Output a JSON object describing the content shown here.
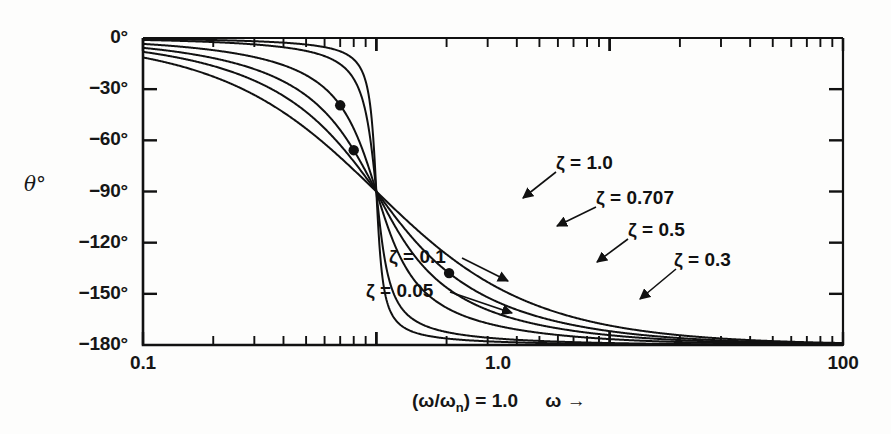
{
  "figure": {
    "kind": "phase-angle-bode-plot",
    "background_color": "#fdfdfc",
    "line_color": "#111111"
  },
  "axes": {
    "y_axis_title": "θ°",
    "y_tick_labels": [
      "0°",
      "−30°",
      "−60°",
      "−90°",
      "−120°",
      "−150°",
      "−180°"
    ],
    "x_tick_labels": [
      "0.1",
      "1.0",
      "100"
    ],
    "x_caption_ratio": "(ω/ω",
    "x_caption_sub": "n",
    "x_caption_rest": ") = 1.0",
    "x_caption_omega": "ω →"
  },
  "curve_labels": [
    {
      "id": "zeta-1-0",
      "text": "ζ = 1.0",
      "x": 556,
      "y": 152
    },
    {
      "id": "zeta-0-707",
      "text": "ζ = 0.707",
      "x": 596,
      "y": 187
    },
    {
      "id": "zeta-0-5",
      "text": "ζ = 0.5",
      "x": 628,
      "y": 219
    },
    {
      "id": "zeta-0-3",
      "text": "ζ = 0.3",
      "x": 674,
      "y": 249
    },
    {
      "id": "zeta-0-1",
      "text": "ζ = 0.1",
      "x": 389,
      "y": 246
    },
    {
      "id": "zeta-0-05",
      "text": "ζ = 0.05",
      "x": 366,
      "y": 280
    }
  ],
  "chart_data": {
    "type": "line",
    "title": "",
    "xlabel": "(ω/ωn) = 1.0   ω →",
    "ylabel": "θ°",
    "xscale": "log",
    "xlim": [
      0.1,
      100
    ],
    "ylim": [
      -180,
      0
    ],
    "yticks": [
      0,
      -30,
      -60,
      -90,
      -120,
      -150,
      -180
    ],
    "ytick_labels": [
      "0°",
      "−30°",
      "−60°",
      "−90°",
      "−120°",
      "−150°",
      "−180°"
    ],
    "xticks": [
      0.1,
      1.0,
      100
    ],
    "xtick_labels": [
      "0.1",
      "1.0",
      "100"
    ],
    "grid": false,
    "legend": "inline-annotations",
    "formula": "theta = -atan2(2*zeta*r, 1 - r^2), r = omega/omega_n",
    "series": [
      {
        "name": "ζ = 1.0",
        "zeta": 1.0,
        "x": [
          0.1,
          0.2,
          0.3,
          0.5,
          0.7,
          1.0,
          1.5,
          2.0,
          3.0,
          5.0,
          10.0,
          30.0,
          100.0
        ],
        "values": [
          -11.5,
          -23.5,
          -36.5,
          -67.4,
          -107.3,
          -90.0,
          -123.9,
          -143.1,
          -153.4,
          -165.1,
          -168.6,
          -173.2,
          -178.9
        ]
      },
      {
        "name": "ζ = 0.707",
        "zeta": 0.707,
        "x": [
          0.1,
          0.2,
          0.3,
          0.5,
          0.7,
          1.0,
          1.5,
          2.0,
          3.0,
          5.0,
          10.0,
          30.0,
          100.0
        ],
        "values": [
          -8.2,
          -16.8,
          -26.3,
          -43.3,
          -68.9,
          -90.0,
          -131.6,
          -146.6,
          -157.8,
          -163.7,
          -171.8,
          -177.3,
          -179.2
        ]
      },
      {
        "name": "ζ = 0.5",
        "zeta": 0.5,
        "x": [
          0.1,
          0.2,
          0.3,
          0.5,
          0.7,
          1.0,
          1.5,
          2.0,
          3.0,
          5.0,
          10.0,
          30.0,
          100.0
        ],
        "values": [
          -5.8,
          -11.9,
          -18.8,
          -33.7,
          -56.4,
          -90.0,
          -140.2,
          -146.3,
          -161.6,
          -168.3,
          -174.2,
          -178.0,
          -179.4
        ]
      },
      {
        "name": "ζ = 0.3",
        "zeta": 0.3,
        "x": [
          0.1,
          0.2,
          0.3,
          0.5,
          0.7,
          1.0,
          1.5,
          2.0,
          3.0,
          5.0,
          10.0,
          30.0,
          100.0
        ],
        "values": [
          -3.5,
          -7.1,
          -11.3,
          -21.8,
          -39.8,
          -90.0,
          -144.2,
          -158.2,
          -166.6,
          -172.9,
          -176.5,
          -178.8,
          -179.6
        ]
      },
      {
        "name": "ζ = 0.1",
        "zeta": 0.1,
        "x": [
          0.1,
          0.2,
          0.3,
          0.5,
          0.7,
          1.0,
          1.5,
          2.0,
          3.0,
          5.0,
          10.0,
          30.0,
          100.0
        ],
        "values": [
          -1.2,
          -2.4,
          -3.8,
          -7.6,
          -15.7,
          -90.0,
          -166.3,
          -172.4,
          -175.7,
          -177.7,
          -178.8,
          -179.6,
          -179.9
        ]
      },
      {
        "name": "ζ = 0.05",
        "zeta": 0.05,
        "x": [
          0.1,
          0.2,
          0.3,
          0.5,
          0.7,
          1.0,
          1.5,
          2.0,
          3.0,
          5.0,
          10.0,
          30.0,
          100.0
        ],
        "values": [
          -0.6,
          -1.2,
          -1.9,
          -3.8,
          -8.2,
          -90.0,
          -173.1,
          -176.2,
          -177.9,
          -178.8,
          -179.4,
          -179.8,
          -180.0
        ]
      }
    ],
    "markers": [
      {
        "on_series": "ζ = 0.3",
        "x": 0.7,
        "y": -40
      },
      {
        "on_series": "ζ = 0.5",
        "x": 0.8,
        "y": -65
      },
      {
        "on_series": "ζ = 0.707",
        "x": 2.05,
        "y": -137
      }
    ]
  }
}
